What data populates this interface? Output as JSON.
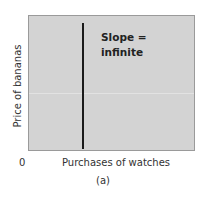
{
  "chart_data": {
    "type": "line",
    "title": "",
    "xlabel": "Purchases of watches",
    "ylabel": "Price of bananas",
    "origin_label": "0",
    "caption": "(a)",
    "annotation": [
      "Slope =",
      "infinite"
    ],
    "series": [
      {
        "name": "vertical line",
        "x": [
          0.32,
          0.32
        ],
        "y": [
          0,
          1
        ]
      }
    ],
    "xlim": [
      0,
      1
    ],
    "ylim": [
      0,
      1
    ],
    "grid": false,
    "legend": null,
    "colors": {
      "background": "#d3d3d3",
      "line": "#1a1a1a"
    }
  }
}
